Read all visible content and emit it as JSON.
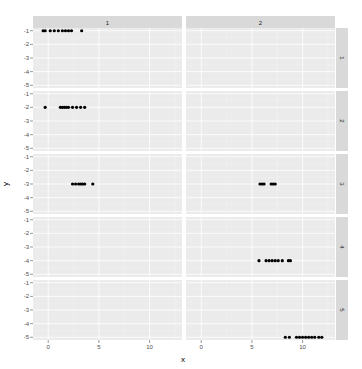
{
  "chart_data": {
    "type": "scatter",
    "title": "",
    "xlabel": "x",
    "ylabel": "y",
    "facet": {
      "cols": [
        "1",
        "2"
      ],
      "rows": [
        "1",
        "2",
        "3",
        "4",
        "5"
      ]
    },
    "xlim": [
      -1.5,
      13.2
    ],
    "ylim": [
      -5.2,
      -0.8
    ],
    "x_ticks": [
      0,
      5,
      10
    ],
    "x_tick_labels": [
      "0",
      "5",
      "10"
    ],
    "y_ticks": [
      -1,
      -2,
      -3,
      -4,
      -5
    ],
    "y_tick_labels": [
      "-1",
      "-2",
      "-3",
      "-4",
      "-5"
    ],
    "grid": true,
    "legend": "none",
    "panels": [
      {
        "col": "1",
        "row": "1",
        "y": -1,
        "x": [
          -0.5,
          -0.3,
          0.2,
          0.6,
          1.0,
          1.4,
          1.7,
          2.0,
          2.3,
          3.3
        ]
      },
      {
        "col": "1",
        "row": "2",
        "y": -2,
        "x": [
          -0.3,
          1.2,
          1.4,
          1.6,
          1.8,
          2.0,
          2.4,
          2.8,
          3.2,
          3.6
        ]
      },
      {
        "col": "1",
        "row": "3",
        "y": -3,
        "x": [
          2.4,
          2.7,
          3.0,
          3.2,
          3.4,
          3.6,
          4.4
        ]
      },
      {
        "col": "2",
        "row": "3",
        "y": -3,
        "x": [
          5.8,
          6.0,
          6.2,
          6.9,
          7.1,
          7.3
        ]
      },
      {
        "col": "2",
        "row": "4",
        "y": -4,
        "x": [
          5.7,
          6.4,
          6.7,
          7.0,
          7.3,
          7.6,
          8.0,
          8.6,
          8.8
        ]
      },
      {
        "col": "2",
        "row": "5",
        "y": -5,
        "x": [
          8.3,
          8.7,
          9.4,
          9.7,
          10.0,
          10.3,
          10.6,
          10.9,
          11.2,
          11.6,
          11.9
        ]
      }
    ],
    "colors": {
      "panel_bg": "#ebebeb",
      "grid_major": "#ffffff",
      "grid_minor": "#f5f5f5",
      "strip_bg": "#d9d9d9",
      "point": "#000000"
    }
  }
}
